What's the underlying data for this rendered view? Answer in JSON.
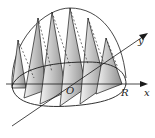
{
  "figure": {
    "labels": {
      "x_axis": "x",
      "y_axis": "y",
      "origin": "O",
      "radius": "R"
    },
    "colors": {
      "stroke": "#1a1a1a",
      "shade_dark": "#8c8c8c",
      "shade_light": "#f2f2f2",
      "background": "#ffffff"
    },
    "cross_section_count": 6
  }
}
